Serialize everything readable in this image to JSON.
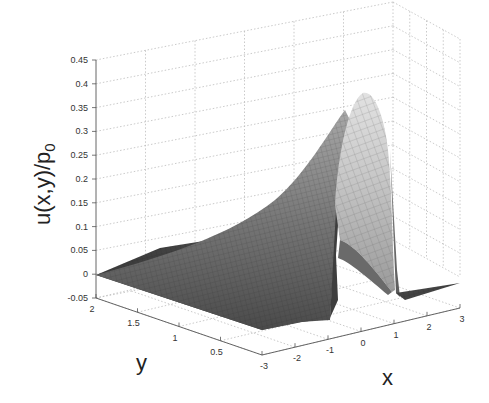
{
  "chart_data": {
    "type": "surface",
    "title": "",
    "zlabel": "u(x,y)/p0",
    "zlabel_main": "u(x,y)/p",
    "zlabel_sub": "0",
    "xlabel": "x",
    "ylabel": "y",
    "zlim": [
      -0.05,
      0.45
    ],
    "xlim": [
      -3,
      3
    ],
    "ylim": [
      0,
      2
    ],
    "z_ticks": [
      "0.45",
      "0.4",
      "0.35",
      "0.3",
      "0.25",
      "0.2",
      "0.15",
      "0.1",
      "0.05",
      "0",
      "-0.05"
    ],
    "x_ticks": [
      "-3",
      "-2",
      "-1",
      "0",
      "1",
      "2",
      "3"
    ],
    "y_ticks": [
      "2",
      "1.5",
      "1",
      "0.5",
      "0"
    ],
    "grid": true,
    "colormap": "gray",
    "peak": {
      "x": 0.5,
      "y": 0,
      "z": 0.375
    },
    "profile_y0": {
      "x": [
        -3,
        -1,
        -1,
        -0.5,
        0,
        0.5,
        1,
        1,
        3
      ],
      "z": [
        0,
        0,
        0.2,
        0.28,
        0.34,
        0.375,
        0.3,
        0,
        0
      ]
    }
  }
}
